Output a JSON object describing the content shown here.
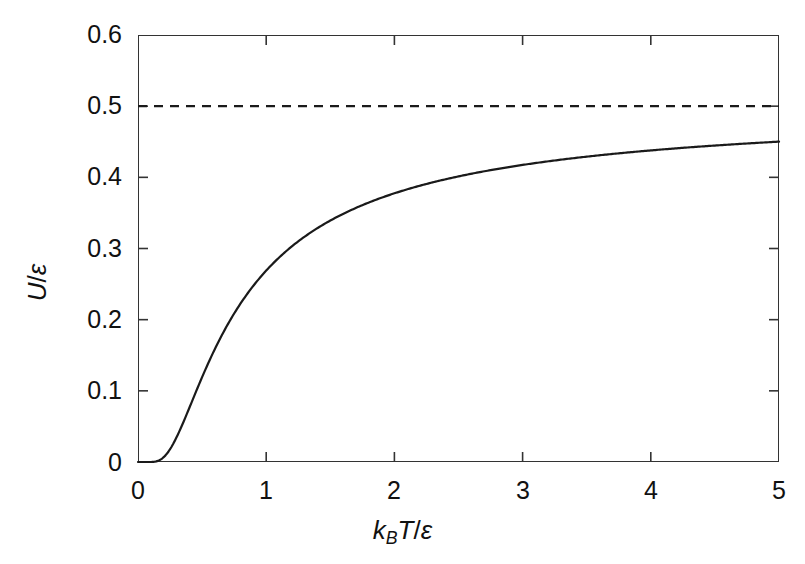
{
  "chart_data": {
    "type": "line",
    "title": "",
    "xlabel": "kBT/ε",
    "ylabel": "U/ε",
    "xlim": [
      0,
      5
    ],
    "ylim": [
      0,
      0.6
    ],
    "grid": false,
    "legend": "none",
    "x_ticks": [
      "0",
      "1",
      "2",
      "3",
      "4",
      "5"
    ],
    "x_tick_values": [
      0,
      1,
      2,
      3,
      4,
      5
    ],
    "y_ticks": [
      "0",
      "0.1",
      "0.2",
      "0.3",
      "0.4",
      "0.5",
      "0.6"
    ],
    "y_tick_values": [
      0,
      0.1,
      0.2,
      0.3,
      0.4,
      0.5,
      0.6
    ],
    "series": [
      {
        "name": "U/ε = 1/(e^(ε/kBT)+1)",
        "style": "solid",
        "color": "#1a1a1a",
        "x": [
          0,
          0.05,
          0.1,
          0.15,
          0.2,
          0.25,
          0.3,
          0.35,
          0.4,
          0.45,
          0.5,
          0.6,
          0.7,
          0.8,
          0.9,
          1.0,
          1.2,
          1.4,
          1.6,
          1.8,
          2.0,
          2.25,
          2.5,
          2.75,
          3.0,
          3.25,
          3.5,
          3.75,
          4.0,
          4.25,
          4.5,
          4.75,
          5.0
        ],
        "y": [
          0.0,
          0.0,
          4.54e-05,
          0.00124,
          0.00669,
          0.018,
          0.0344,
          0.0537,
          0.0759,
          0.0969,
          0.1192,
          0.1589,
          0.1932,
          0.2222,
          0.2464,
          0.2689,
          0.3024,
          0.3268,
          0.3452,
          0.3595,
          0.371,
          0.3824,
          0.3912,
          0.3984,
          0.4044,
          0.4094,
          0.4136,
          0.4173,
          0.4204,
          0.4232,
          0.4256,
          0.4278,
          0.4502
        ]
      },
      {
        "name": "asymptote",
        "style": "dashed",
        "color": "#1a1a1a",
        "x": [
          0,
          5
        ],
        "y": [
          0.5,
          0.5
        ]
      }
    ],
    "annotations": []
  },
  "axis": {
    "x_title_parts": {
      "k": "k",
      "B": "B",
      "T": "T",
      "slash": "/",
      "eps": "ε"
    },
    "y_title_parts": {
      "U": "U",
      "slash": "/",
      "eps": "ε"
    }
  },
  "colors": {
    "curve": "#1a1a1a",
    "asymptote": "#1a1a1a",
    "frame": "#333333",
    "background": "#ffffff",
    "text": "#111111"
  }
}
